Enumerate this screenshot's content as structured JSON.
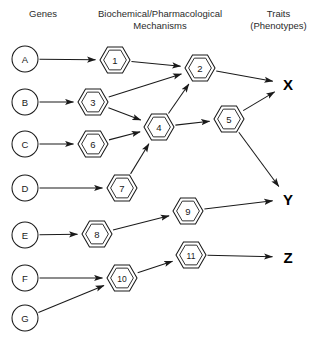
{
  "headers": {
    "genes": "Genes",
    "mechanisms": "Biochemical/Pharmacological\nMechanisms",
    "traits": "Traits\n(Phenotypes)"
  },
  "colors": {
    "stroke": "#1a1a1a",
    "background": "#ffffff",
    "header_text": "#2b2b2b",
    "trait_text": "#000000"
  },
  "chart_data": {
    "type": "diagram",
    "layout": "left-to-right directed acyclic graph, three columns",
    "columns": [
      "Genes",
      "Biochemical/Pharmacological Mechanisms",
      "Traits (Phenotypes)"
    ],
    "genes": [
      {
        "id": "A",
        "label": "A",
        "x": 25,
        "y": 59,
        "r": 13
      },
      {
        "id": "B",
        "label": "B",
        "x": 25,
        "y": 102,
        "r": 13
      },
      {
        "id": "C",
        "label": "C",
        "x": 25,
        "y": 144,
        "r": 13
      },
      {
        "id": "D",
        "label": "D",
        "x": 25,
        "y": 188,
        "r": 13
      },
      {
        "id": "E",
        "label": "E",
        "x": 25,
        "y": 235,
        "r": 13
      },
      {
        "id": "F",
        "label": "F",
        "x": 25,
        "y": 278,
        "r": 13
      },
      {
        "id": "G",
        "label": "G",
        "x": 25,
        "y": 318,
        "r": 13
      }
    ],
    "mechanisms": [
      {
        "id": "1",
        "label": "1",
        "x": 115,
        "y": 60,
        "r": 15
      },
      {
        "id": "2",
        "label": "2",
        "x": 200,
        "y": 68,
        "r": 15
      },
      {
        "id": "3",
        "label": "3",
        "x": 93,
        "y": 102,
        "r": 15
      },
      {
        "id": "4",
        "label": "4",
        "x": 159,
        "y": 127,
        "r": 15
      },
      {
        "id": "5",
        "label": "5",
        "x": 229,
        "y": 119,
        "r": 15
      },
      {
        "id": "6",
        "label": "6",
        "x": 93,
        "y": 144,
        "r": 15
      },
      {
        "id": "7",
        "label": "7",
        "x": 122,
        "y": 188,
        "r": 15
      },
      {
        "id": "8",
        "label": "8",
        "x": 97,
        "y": 234,
        "r": 15
      },
      {
        "id": "9",
        "label": "9",
        "x": 188,
        "y": 211,
        "r": 15
      },
      {
        "id": "10",
        "label": "10",
        "x": 122,
        "y": 278,
        "r": 15
      },
      {
        "id": "11",
        "label": "11",
        "x": 191,
        "y": 255,
        "r": 15
      }
    ],
    "traits": [
      {
        "id": "X",
        "label": "X",
        "x": 288,
        "y": 84
      },
      {
        "id": "Y",
        "label": "Y",
        "x": 288,
        "y": 199
      },
      {
        "id": "Z",
        "label": "Z",
        "x": 288,
        "y": 257
      }
    ],
    "edges": [
      {
        "from": "A",
        "to": "1"
      },
      {
        "from": "B",
        "to": "3"
      },
      {
        "from": "C",
        "to": "6"
      },
      {
        "from": "D",
        "to": "7"
      },
      {
        "from": "E",
        "to": "8"
      },
      {
        "from": "F",
        "to": "10"
      },
      {
        "from": "G",
        "to": "10"
      },
      {
        "from": "1",
        "to": "2"
      },
      {
        "from": "3",
        "to": "2"
      },
      {
        "from": "3",
        "to": "4"
      },
      {
        "from": "6",
        "to": "4"
      },
      {
        "from": "7",
        "to": "4"
      },
      {
        "from": "4",
        "to": "2"
      },
      {
        "from": "4",
        "to": "5"
      },
      {
        "from": "8",
        "to": "9"
      },
      {
        "from": "10",
        "to": "11"
      },
      {
        "from": "2",
        "to": "X"
      },
      {
        "from": "5",
        "to": "X"
      },
      {
        "from": "5",
        "to": "Y"
      },
      {
        "from": "9",
        "to": "Y"
      },
      {
        "from": "11",
        "to": "Z"
      }
    ]
  }
}
